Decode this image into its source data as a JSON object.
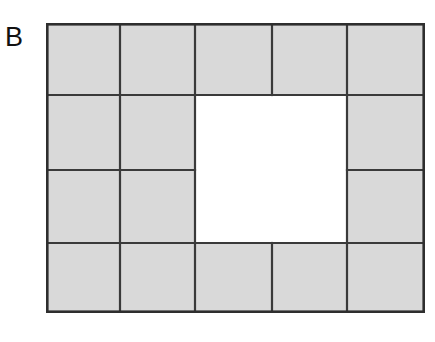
{
  "figure": {
    "panel_label": "B",
    "colors": {
      "tile_fill": "#d9d9d9",
      "hole_fill": "#ffffff",
      "tile_edge": "#3a3a3a",
      "outer_edge": "#2e2e2e",
      "background": "#ffffff",
      "label_color": "#111111"
    },
    "geometry": {
      "outer_left": 0,
      "outer_top": 0,
      "outer_right": 379,
      "outer_bottom": 290,
      "column_edges": [
        0,
        74,
        149,
        226,
        301,
        379
      ],
      "row_edges": [
        0,
        72,
        147,
        220,
        290
      ],
      "hole": {
        "left": 149,
        "top": 72,
        "right": 301,
        "bottom": 220
      }
    },
    "tiles": [
      {
        "name": "tile-r1c1",
        "x": 0,
        "y": 0,
        "w": 74,
        "h": 72
      },
      {
        "name": "tile-r1c2",
        "x": 74,
        "y": 0,
        "w": 75,
        "h": 72
      },
      {
        "name": "tile-r1c3",
        "x": 149,
        "y": 0,
        "w": 77,
        "h": 72
      },
      {
        "name": "tile-r1c4",
        "x": 226,
        "y": 0,
        "w": 75,
        "h": 72
      },
      {
        "name": "tile-r1c5",
        "x": 301,
        "y": 0,
        "w": 78,
        "h": 72
      },
      {
        "name": "tile-r2c1",
        "x": 0,
        "y": 72,
        "w": 74,
        "h": 75
      },
      {
        "name": "tile-r2c2",
        "x": 74,
        "y": 72,
        "w": 75,
        "h": 75
      },
      {
        "name": "tile-r2c5",
        "x": 301,
        "y": 72,
        "w": 78,
        "h": 75
      },
      {
        "name": "tile-r3c1",
        "x": 0,
        "y": 147,
        "w": 74,
        "h": 73
      },
      {
        "name": "tile-r3c2",
        "x": 74,
        "y": 147,
        "w": 75,
        "h": 73
      },
      {
        "name": "tile-r3c5",
        "x": 301,
        "y": 147,
        "w": 78,
        "h": 73
      },
      {
        "name": "tile-r4c1",
        "x": 0,
        "y": 220,
        "w": 74,
        "h": 70
      },
      {
        "name": "tile-r4c2",
        "x": 74,
        "y": 220,
        "w": 75,
        "h": 70
      },
      {
        "name": "tile-r4c3",
        "x": 149,
        "y": 220,
        "w": 77,
        "h": 70
      },
      {
        "name": "tile-r4c4",
        "x": 226,
        "y": 220,
        "w": 75,
        "h": 70
      },
      {
        "name": "tile-r4c5",
        "x": 301,
        "y": 220,
        "w": 78,
        "h": 70
      }
    ],
    "tile_count": 16,
    "grid_columns": 5,
    "grid_rows": 4
  }
}
